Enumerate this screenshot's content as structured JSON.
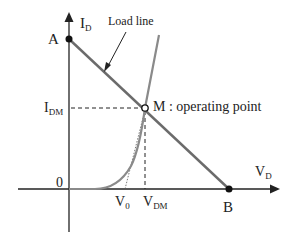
{
  "diagram": {
    "axes": {
      "y_label": "I",
      "y_sub": "D",
      "x_label": "V",
      "x_sub": "D",
      "origin_label": "0"
    },
    "points": {
      "A": "A",
      "B": "B",
      "M": "M : operating point"
    },
    "annotations": {
      "load_line": "Load line",
      "idm_label": "I",
      "idm_sub": "DM",
      "v0_label": "V",
      "v0_sub": "0",
      "vdm_label": "V",
      "vdm_sub": "DM"
    },
    "colors": {
      "line": "#6b6b6b",
      "axis": "#222222",
      "curve": "#8a8a8a"
    }
  }
}
